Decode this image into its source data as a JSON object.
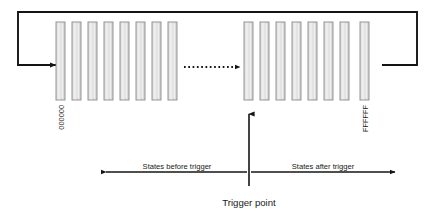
{
  "diagram": {
    "title": "Trigger point",
    "colors": {
      "bar_fill": "#e2e2e2",
      "bar_stroke": "#8c8c8c",
      "bar_inner_line": "#f4f4f4",
      "line": "#141414",
      "text": "#1a1a1a",
      "background": "#ffffff"
    },
    "labels": {
      "start_state": "000000",
      "end_state": "FFFFFF",
      "before_trigger": "States before trigger",
      "after_trigger": "States after trigger",
      "trigger_point": "Trigger point"
    },
    "memory": {
      "left_group_bar_count": 8,
      "right_group_bar_count": 8,
      "bar_width": 9,
      "bar_pitch": 16,
      "bar_top": 22,
      "bar_bottom": 100,
      "left_group_start_x": 56,
      "right_group_start_x": 244,
      "ellipsis_style": "dotted-arrow"
    },
    "loop": {
      "top_y": 12,
      "return_y": 65,
      "left_x": 18,
      "right_x": 417,
      "arrow_direction": "right"
    },
    "trigger": {
      "x": 249,
      "arrow_top_y": 113,
      "arrow_bottom_y": 186,
      "arrow_direction": "up"
    },
    "span_axis": {
      "y": 172,
      "left_end_x": 103,
      "right_end_x": 398,
      "before_direction": "left",
      "after_direction": "right"
    }
  }
}
